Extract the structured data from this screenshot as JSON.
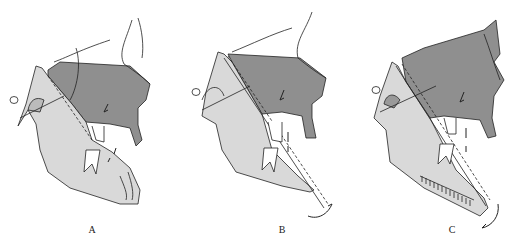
{
  "figure": {
    "type": "cephalometric-diagram",
    "panels": [
      {
        "id": "A",
        "label": "A",
        "description": "Mandible and maxilla with closed occlusion; bite opening indicated by arrows",
        "rotation_arrow": false,
        "ruler_marks": false
      },
      {
        "id": "B",
        "label": "B",
        "description": "Dashed reference line through condyle and chin; clockwise mandibular rotation arrow",
        "rotation_arrow": true,
        "ruler_marks": false
      },
      {
        "id": "C",
        "label": "C",
        "description": "Increased rotation with hatched mandibular border; counterclockwise arrow at chin",
        "rotation_arrow": true,
        "ruler_marks": true
      }
    ],
    "colors": {
      "maxilla_fill": "#8f8f8f",
      "mandible_fill": "#d9d9d9",
      "line": "#222222",
      "background": "#ffffff"
    }
  }
}
